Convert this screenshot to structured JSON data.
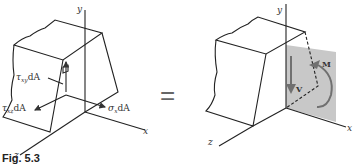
{
  "figure": {
    "caption": "Fig. 5.3",
    "equals_sign": "="
  },
  "left_diagram": {
    "axes": {
      "x": "x",
      "y": "y",
      "z": "z"
    },
    "labels": {
      "tau_xy": "τ",
      "tau_xy_sub": "xy",
      "tau_xy_suffix": "dA",
      "tau_xz": "τ",
      "tau_xz_sub": "xz",
      "tau_xz_suffix": "dA",
      "sigma_x": "σ",
      "sigma_x_sub": "x",
      "sigma_x_suffix": "dA"
    }
  },
  "right_diagram": {
    "axes": {
      "x": "x",
      "y": "y",
      "z": "z"
    },
    "labels": {
      "shear": "V",
      "moment": "M"
    },
    "colors": {
      "section_fill": "#c8c8c8",
      "arrow": "#707070"
    }
  }
}
